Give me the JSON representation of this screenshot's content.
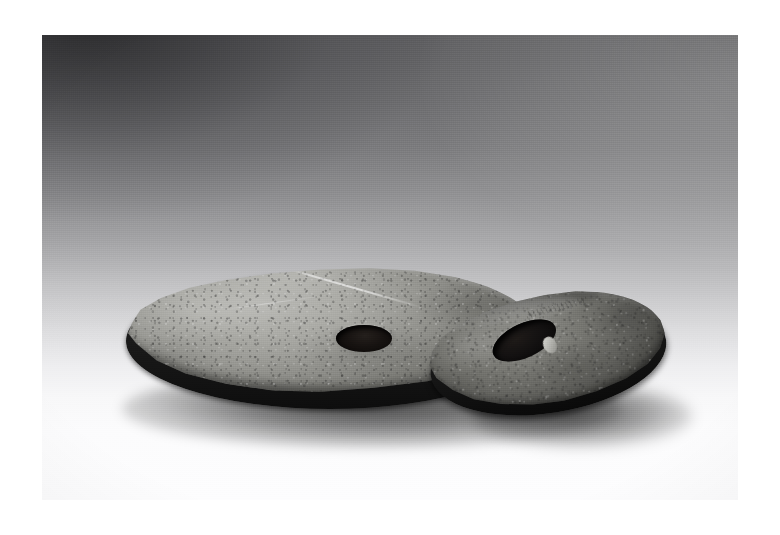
{
  "page": {
    "background_color": "#ffffff",
    "canvas_width": 780,
    "canvas_height": 535
  },
  "photograph": {
    "type": "black-and-white studio photograph",
    "subject": "Two perforated stone discs",
    "plate_left": 42,
    "plate_top": 35,
    "plate_width": 696,
    "plate_height": 465,
    "backdrop": {
      "description": "Seamless studio sweep, dark grey upper-left graduating to white lower-right",
      "color_dark": "#4f4f52",
      "color_mid": "#a9a9ab",
      "color_light": "#fdfdfe"
    },
    "lighting": "Soft directional light from upper right; cast shadows fall forward and left",
    "surface_color": "#9e9e99",
    "shadow_color": "#0a0a0a"
  },
  "objects": [
    {
      "id": "disc-large",
      "label": "Large perforated stone disc",
      "position": "foreground left, lying flat",
      "color_light": "#b9b9b5",
      "color_mid": "#9e9e99",
      "color_dark": "#6e6e6a",
      "edge_color": "#141414",
      "surface": "coarse pitted stone with pale incised score line across the upper face",
      "hole": {
        "label": "central perforation",
        "shape": "ellipse",
        "color": "#0a0807"
      }
    },
    {
      "id": "disc-small",
      "label": "Smaller perforated stone disc",
      "position": "right, tilted and leaning against the large disc",
      "color_light": "#8d8d88",
      "color_mid": "#6f6f6a",
      "color_dark": "#434340",
      "edge_color": "#0d0d0d",
      "surface": "darker weathered stone with faint incised marks near the upper rim",
      "hole": {
        "label": "central perforation",
        "shape": "ellipse, elongated by the tilt",
        "color": "#070606",
        "inclusion": "pale chip of stone visible inside the right wall of the bore"
      }
    }
  ],
  "accessibility": {
    "alt_text": "Black and white photograph of two round stone discs, each with a hole bored through the centre. The larger disc lies flat in the foreground; the smaller, darker disc is propped at an angle behind and to the right of it, against a graduated grey studio backdrop."
  }
}
